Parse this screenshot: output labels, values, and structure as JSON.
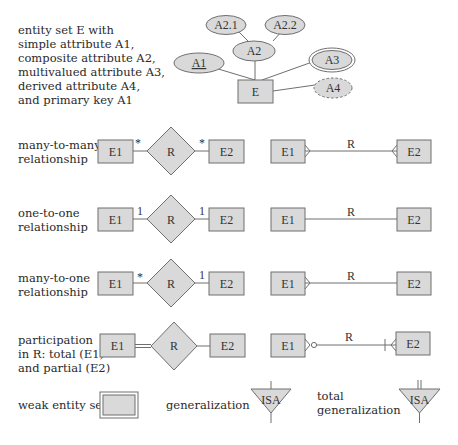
{
  "colors": {
    "fill": "#d9d9d9",
    "stroke": "#6f6f6f",
    "text": "#2a2a2a",
    "background": "#ffffff"
  },
  "entity_legend": {
    "description": "entity set E with\nsimple attribute A1,\ncomposite attribute A2,\nmultivalued attribute A3,\nderived attribute A4,\nand primary key A1",
    "entity": "E",
    "attributes": {
      "simple_key": "A1",
      "composite": "A2",
      "component1": "A2.1",
      "component2": "A2.2",
      "multivalued": "A3",
      "derived": "A4"
    }
  },
  "rows": [
    {
      "label": "many-to-many\nrelationship",
      "left": "E1",
      "rel": "R",
      "right": "E2",
      "left_card": "*",
      "right_card": "*",
      "crow_rel": "R"
    },
    {
      "label": "one-to-one\nrelationship",
      "left": "E1",
      "rel": "R",
      "right": "E2",
      "left_card": "1",
      "right_card": "1",
      "crow_rel": "R"
    },
    {
      "label": "many-to-one\nrelationship",
      "left": "E1",
      "rel": "R",
      "right": "E2",
      "left_card": "*",
      "right_card": "1",
      "crow_rel": "R"
    },
    {
      "label": "participation\nin R: total (E1)\nand partial (E2)",
      "left": "E1",
      "rel": "R",
      "right": "E2",
      "left_card": "",
      "right_card": "",
      "crow_rel": "R"
    }
  ],
  "bottom": {
    "weak_entity_label": "weak entity set",
    "generalization_label": "generalization",
    "isa": "ISA",
    "total_generalization_label": "total\ngeneralization",
    "isa_total": "ISA"
  }
}
